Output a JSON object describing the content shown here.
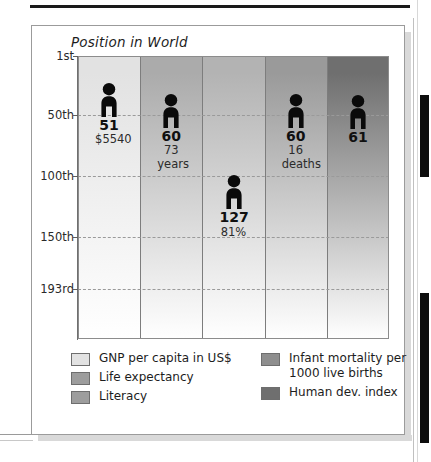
{
  "chart_title": "Position in World",
  "chart_data": {
    "type": "bar",
    "title": "Position in World",
    "xlabel": "",
    "ylabel": "Position in World",
    "ylim": [
      1,
      193
    ],
    "grid": true,
    "y_ticks": [
      {
        "label": "1st",
        "value": 1
      },
      {
        "label": "50th",
        "value": 50
      },
      {
        "label": "100th",
        "value": 100
      },
      {
        "label": "150th",
        "value": 150
      },
      {
        "label": "193rd",
        "value": 193
      }
    ],
    "categories": [
      "GNP per capita in US$",
      "Life expectancy",
      "Literacy",
      "Infant mortality per 1000 live births",
      "Human dev. index"
    ],
    "values": [
      51,
      60,
      127,
      60,
      61
    ],
    "points": [
      {
        "category": "GNP per capita in US$",
        "rank": 51,
        "rank_label": "51",
        "detail": "$5540",
        "color": "#e2e2e2"
      },
      {
        "category": "Life expectancy",
        "rank": 60,
        "rank_label": "60",
        "detail": "73 years",
        "color": "#ababab"
      },
      {
        "category": "Literacy",
        "rank": 127,
        "rank_label": "127",
        "detail": "81%",
        "color": "#b3b3b3"
      },
      {
        "category": "Infant mortality per 1000 live births",
        "rank": 60,
        "rank_label": "60",
        "detail": "16 deaths",
        "color": "#9a9a9a"
      },
      {
        "category": "Human dev. index",
        "rank": 61,
        "rank_label": "61",
        "detail": "",
        "color": "#6f6f6f"
      }
    ]
  },
  "figures": [
    {
      "value": "51",
      "sub1": "$5540",
      "sub2": ""
    },
    {
      "value": "60",
      "sub1": "73",
      "sub2": "years"
    },
    {
      "value": "127",
      "sub1": "81%",
      "sub2": ""
    },
    {
      "value": "60",
      "sub1": "16",
      "sub2": "deaths"
    },
    {
      "value": "61",
      "sub1": "",
      "sub2": ""
    }
  ],
  "y_axis": {
    "tick_1": "1st",
    "tick_2": "50th",
    "tick_3": "100th",
    "tick_4": "150th",
    "tick_5": "193rd"
  },
  "legend": {
    "left": [
      {
        "label": "GNP per capita in US$",
        "color": "#e2e2e2"
      },
      {
        "label": "Life expectancy",
        "color": "#9d9d9d"
      },
      {
        "label": "Literacy",
        "color": "#9d9d9d"
      }
    ],
    "right": [
      {
        "label": "Infant mortality per 1000 live births",
        "color": "#8e8e8e"
      },
      {
        "label": "Human dev. index",
        "color": "#6f6f6f"
      }
    ]
  }
}
